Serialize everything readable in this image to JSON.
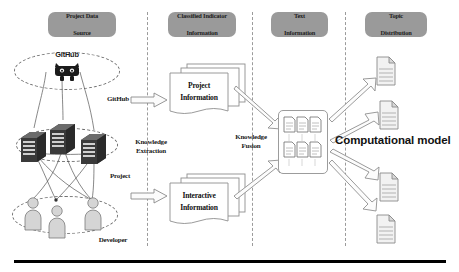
{
  "figure": {
    "bottom_rule": true
  },
  "stages": [
    {
      "id": "project-data-source",
      "line1": "Project Data",
      "line2": "Source"
    },
    {
      "id": "classified-indicator",
      "line1": "Classified Indicator",
      "line2": "Information"
    },
    {
      "id": "text-information",
      "line1": "Text",
      "line2": "Information"
    },
    {
      "id": "topic-distribution",
      "line1": "Topic",
      "line2": "Distribution"
    }
  ],
  "source": {
    "github_logo_text": "GitHub",
    "github_label": "GitHub",
    "project_label": "Project",
    "developer_label": "Developer",
    "server_count": 3,
    "developer_count": 3
  },
  "extraction": {
    "label_line1": "Knowledge",
    "label_line2": "Extraction"
  },
  "documents": [
    {
      "id": "project-information",
      "line1": "Project",
      "line2": "Information"
    },
    {
      "id": "interactive-information",
      "line1": "Interactive",
      "line2": "Information"
    }
  ],
  "fusion": {
    "label_line1": "Knowledge",
    "label_line2": "Fusion",
    "icon_rows": 2,
    "icon_cols": 3
  },
  "model": {
    "label": "Computational model"
  },
  "topics": {
    "count": 4
  },
  "colors": {
    "pill_bg": "#9a9a9a",
    "text": "#1a1a1a",
    "line": "#6f6f6f",
    "rule": "#000000"
  }
}
